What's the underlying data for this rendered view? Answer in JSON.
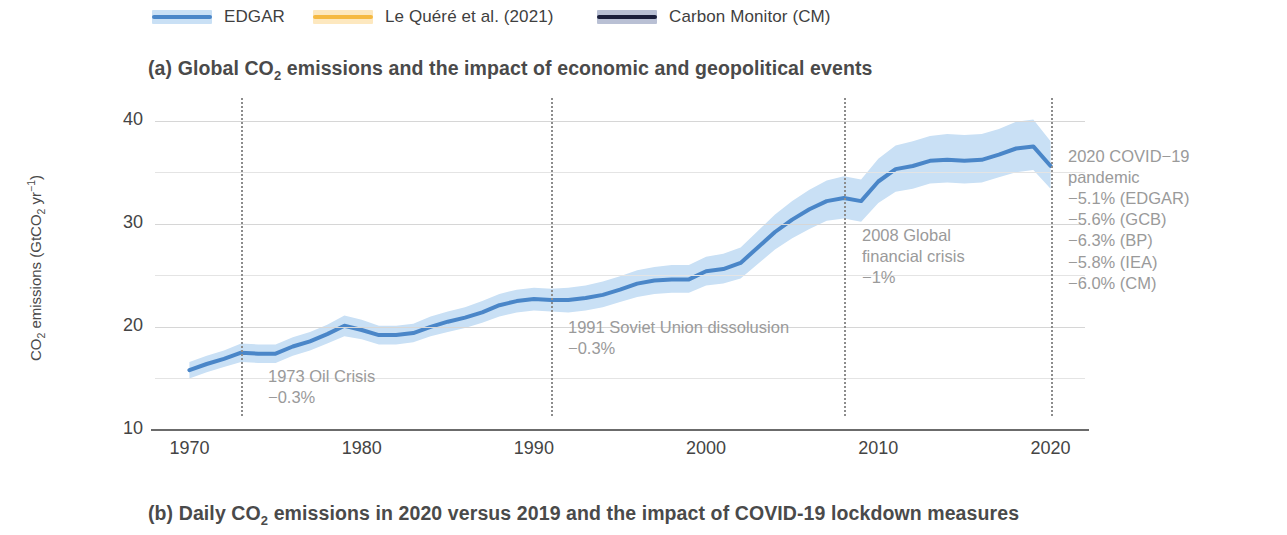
{
  "legend": {
    "items": [
      {
        "label": "EDGAR",
        "band": "#c9e0f5",
        "core": "#4a86c8",
        "x": 152
      },
      {
        "label": "Le Quéré et al. (2021)",
        "band": "#fde8bf",
        "core": "#f5b942",
        "x": 313
      },
      {
        "label": "Carbon Monitor (CM)",
        "band": "#b9c0d4",
        "core": "#1b1f3b",
        "x": 597
      }
    ]
  },
  "panel_a": {
    "title_pre": "(a) Global CO",
    "title_sub": "2",
    "title_post": " emissions and the impact of economic and geopolitical events"
  },
  "panel_b": {
    "title_pre": "(b) Daily CO",
    "title_sub": "2",
    "title_post": " emissions in 2020 versus 2019 and the impact of COVID-19 lockdown measures"
  },
  "axes": {
    "ylabel_pre": "CO",
    "ylabel_sub1": "2",
    "ylabel_mid": " emissions (GtCO",
    "ylabel_sub2": "2",
    "ylabel_unit": " yr",
    "ylabel_sup": "−1",
    "ylabel_post": ")"
  },
  "annotations": [
    {
      "id": "1973",
      "lines": [
        "1973 Oil Crisis",
        "−0.3%"
      ]
    },
    {
      "id": "1991",
      "lines": [
        "1991 Soviet Union dissolusion",
        "−0.3%"
      ]
    },
    {
      "id": "2008",
      "lines": [
        "2008 Global",
        "financial crisis",
        "−1%"
      ]
    },
    {
      "id": "2020",
      "lines": [
        "2020 COVID−19",
        "pandemic",
        "−5.1% (EDGAR)",
        "−5.6% (GCB)",
        "−6.3% (BP)",
        "−5.8% (IEA)",
        "−6.0% (CM)"
      ]
    }
  ],
  "chart_data": {
    "type": "line",
    "title": "(a) Global CO2 emissions and the impact of economic and geopolitical events",
    "xlabel": "",
    "ylabel": "CO2 emissions (GtCO2 yr-1)",
    "xlim": [
      1968,
      2022
    ],
    "ylim": [
      10,
      42
    ],
    "yticks": [
      10,
      20,
      30,
      40
    ],
    "yticks_minor": [
      15,
      25,
      35
    ],
    "xticks": [
      1970,
      1980,
      1990,
      2000,
      2010,
      2020
    ],
    "grid": true,
    "legend_position": "above-plot",
    "event_lines": [
      1973,
      1991,
      2008,
      2020
    ],
    "x": [
      1970,
      1971,
      1972,
      1973,
      1974,
      1975,
      1976,
      1977,
      1978,
      1979,
      1980,
      1981,
      1982,
      1983,
      1984,
      1985,
      1986,
      1987,
      1988,
      1989,
      1990,
      1991,
      1992,
      1993,
      1994,
      1995,
      1996,
      1997,
      1998,
      1999,
      2000,
      2001,
      2002,
      2003,
      2004,
      2005,
      2006,
      2007,
      2008,
      2009,
      2010,
      2011,
      2012,
      2013,
      2014,
      2015,
      2016,
      2017,
      2018,
      2019,
      2020
    ],
    "series": [
      {
        "name": "EDGAR",
        "color": "#4a86c8",
        "band_color": "#c9e0f5",
        "values": [
          15.8,
          16.4,
          16.9,
          17.5,
          17.4,
          17.4,
          18.1,
          18.6,
          19.3,
          20.1,
          19.7,
          19.2,
          19.2,
          19.4,
          20.0,
          20.5,
          20.9,
          21.4,
          22.1,
          22.5,
          22.7,
          22.6,
          22.6,
          22.8,
          23.1,
          23.6,
          24.2,
          24.5,
          24.6,
          24.6,
          25.4,
          25.6,
          26.2,
          27.7,
          29.2,
          30.4,
          31.4,
          32.2,
          32.5,
          32.2,
          34.1,
          35.3,
          35.6,
          36.1,
          36.2,
          36.1,
          36.2,
          36.7,
          37.3,
          37.5,
          35.6
        ],
        "band_lower": [
          15.0,
          15.6,
          16.1,
          16.6,
          16.5,
          16.5,
          17.2,
          17.7,
          18.4,
          19.1,
          18.8,
          18.3,
          18.3,
          18.5,
          19.1,
          19.5,
          19.9,
          20.4,
          21.0,
          21.4,
          21.6,
          21.5,
          21.4,
          21.6,
          21.9,
          22.4,
          22.9,
          23.2,
          23.3,
          23.3,
          24.0,
          24.2,
          24.7,
          26.1,
          27.5,
          28.6,
          29.5,
          30.3,
          30.5,
          30.2,
          32.0,
          33.1,
          33.4,
          33.9,
          34.0,
          33.9,
          34.0,
          34.5,
          35.0,
          35.2,
          33.4
        ],
        "band_upper": [
          16.6,
          17.2,
          17.7,
          18.4,
          18.3,
          18.3,
          19.0,
          19.5,
          20.2,
          21.1,
          20.7,
          20.1,
          20.1,
          20.3,
          21.0,
          21.5,
          21.9,
          22.5,
          23.2,
          23.6,
          23.8,
          23.7,
          23.8,
          24.0,
          24.4,
          24.9,
          25.5,
          25.8,
          26.0,
          26.0,
          26.8,
          27.1,
          27.7,
          29.3,
          30.9,
          32.2,
          33.3,
          34.2,
          34.6,
          34.3,
          36.3,
          37.6,
          38.0,
          38.5,
          38.7,
          38.6,
          38.7,
          39.2,
          39.9,
          40.1,
          38.0
        ]
      }
    ],
    "event_annotations": [
      {
        "year": 1973,
        "text": "1973 Oil Crisis",
        "change": "-0.3%"
      },
      {
        "year": 1991,
        "text": "1991 Soviet Union dissolusion",
        "change": "-0.3%"
      },
      {
        "year": 2008,
        "text": "2008 Global financial crisis",
        "change": "-1%"
      },
      {
        "year": 2020,
        "text": "2020 COVID-19 pandemic",
        "change": [
          "-5.1% (EDGAR)",
          "-5.6% (GCB)",
          "-6.3% (BP)",
          "-5.8% (IEA)",
          "-6.0% (CM)"
        ]
      }
    ]
  }
}
